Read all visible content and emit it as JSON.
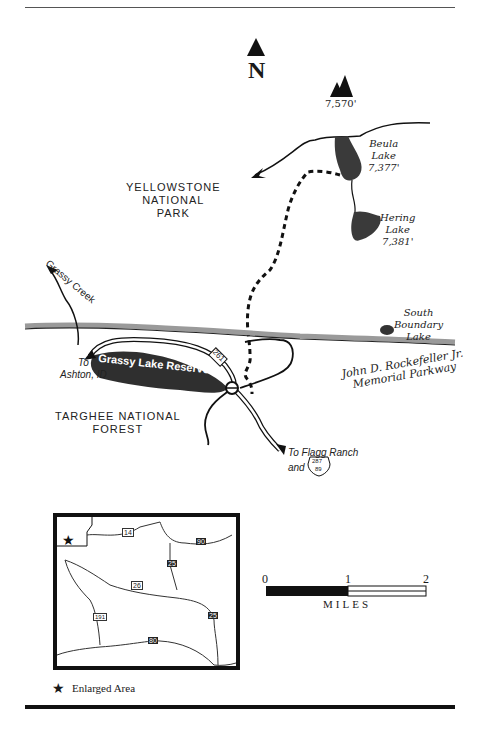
{
  "header": {
    "title_clipped": "TRAIL TO BEULA LAKE"
  },
  "compass": {
    "label": "N"
  },
  "peak": {
    "elevation": "7,570'"
  },
  "lakes": [
    {
      "name": "Beula",
      "name2": "Lake",
      "elevation": "7,377'"
    },
    {
      "name": "Hering",
      "name2": "Lake",
      "elevation": "7,381'"
    },
    {
      "name": "South",
      "name2": "Boundary",
      "name3": "Lake"
    }
  ],
  "areas": {
    "yellowstone": [
      "YELLOWSTONE",
      "NATIONAL",
      "PARK"
    ],
    "targhee": [
      "TARGHEE NATIONAL",
      "FOREST"
    ],
    "parkway": [
      "John D. Rockefeller Jr.",
      "Memorial Parkway"
    ]
  },
  "features": {
    "creek": "Grassy Creek",
    "reservoir": "Grassy Lake Reservoir",
    "to_ashton": [
      "To",
      "Ashton, ID"
    ],
    "to_flagg": "To Flagg Ranch",
    "and": "and",
    "route_261": "261",
    "us_287": "287",
    "us_89": "89"
  },
  "inset": {
    "routes": {
      "us14": "14",
      "i90": "90",
      "i25a": "25",
      "us26": "26",
      "i25b": "25",
      "us191": "191",
      "i80": "80"
    }
  },
  "scale": {
    "ticks": [
      "0",
      "1",
      "2"
    ],
    "unit": "MILES"
  },
  "legend": {
    "symbol": "★",
    "label": "Enlarged Area"
  },
  "colors": {
    "ink": "#1a1a1a",
    "lake_fill": "#3a3a3a",
    "boundary": "#9a9a9a"
  }
}
